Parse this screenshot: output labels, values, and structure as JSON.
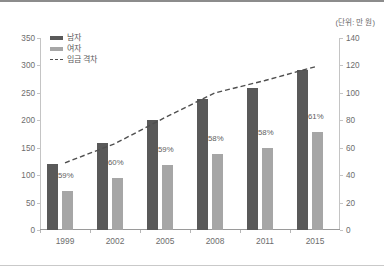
{
  "unit_note": "(단위: 만 원)",
  "legend": {
    "items": [
      {
        "label": "남자",
        "key": "male"
      },
      {
        "label": "여자",
        "key": "female"
      },
      {
        "label": "임금 격차",
        "key": "gap"
      }
    ]
  },
  "axes": {
    "left_ticks": [
      "0",
      "50",
      "100",
      "150",
      "200",
      "250",
      "300",
      "350"
    ],
    "right_ticks": [
      "0",
      "20",
      "40",
      "60",
      "80",
      "100",
      "120",
      "140"
    ],
    "left_max": 350,
    "right_max": 140
  },
  "colors": {
    "male_bar": "#595959",
    "female_bar": "#a6a6a6",
    "gap_line": "#4f4f4f",
    "axis": "#c4c4c4",
    "text": "#6d6d6d"
  },
  "chart_data": {
    "type": "bar",
    "title": "",
    "subtitle": "",
    "xlabel": "",
    "ylabel": "",
    "categories": [
      "1999",
      "2002",
      "2005",
      "2008",
      "2011",
      "2015"
    ],
    "ylim": [
      0,
      350
    ],
    "y2lim": [
      0,
      140
    ],
    "grid": false,
    "legend_position": "top-left",
    "series": [
      {
        "name": "남자",
        "type": "bar",
        "axis": "left",
        "values": [
          120,
          158,
          200,
          238,
          259,
          292
        ]
      },
      {
        "name": "여자",
        "type": "bar",
        "axis": "left",
        "values": [
          71,
          95,
          118,
          138,
          150,
          178
        ]
      },
      {
        "name": "임금 격차",
        "type": "line",
        "axis": "right",
        "style": "dashed",
        "values": [
          49,
          63,
          82,
          100,
          109,
          119
        ]
      }
    ],
    "data_labels": {
      "series": "여자",
      "values": [
        "59%",
        "60%",
        "59%",
        "58%",
        "58%",
        "61%"
      ]
    }
  }
}
